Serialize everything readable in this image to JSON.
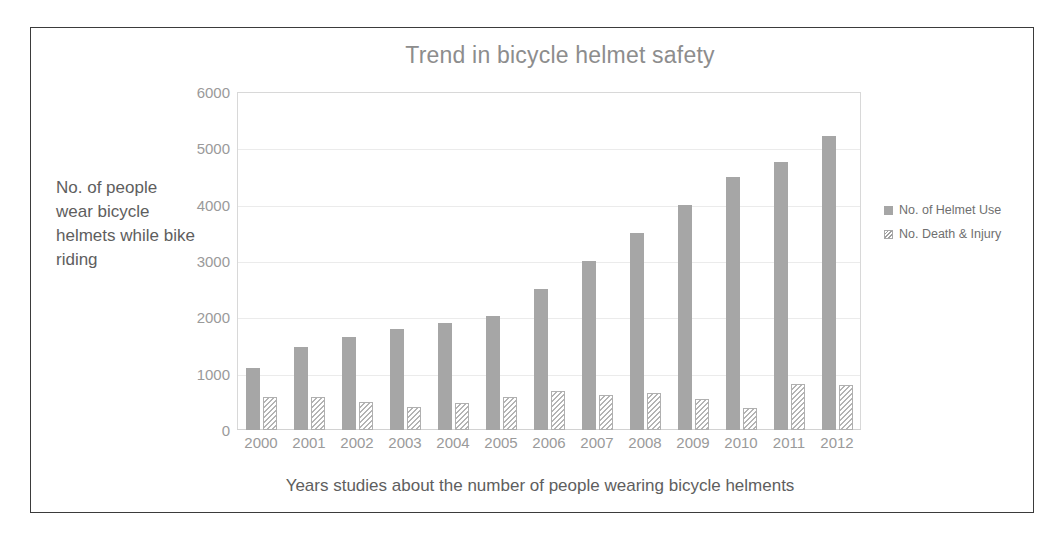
{
  "chart_data": {
    "type": "bar",
    "title": "Trend in bicycle helmet safety",
    "xlabel": "Years studies about the number of people wearing bicycle helments",
    "ylabel": "No. of people wear bicycle helmets while bike riding",
    "categories": [
      "2000",
      "2001",
      "2002",
      "2003",
      "2004",
      "2005",
      "2006",
      "2007",
      "2008",
      "2009",
      "2010",
      "2011",
      "2012"
    ],
    "series": [
      {
        "name": "No. of Helmet Use",
        "color": "#a6a6a6",
        "values": [
          1100,
          1480,
          1650,
          1790,
          1900,
          2020,
          2500,
          3000,
          3490,
          4000,
          4490,
          4760,
          5220
        ]
      },
      {
        "name": "No. Death & Injury",
        "color": "#ffffff",
        "values": [
          580,
          590,
          490,
          400,
          480,
          590,
          700,
          620,
          650,
          550,
          390,
          810,
          800
        ]
      }
    ],
    "ylim": [
      0,
      6000
    ],
    "yticks": [
      0,
      1000,
      2000,
      3000,
      4000,
      5000,
      6000
    ],
    "ytick_labels": [
      "0",
      "1000",
      "2000",
      "3000",
      "4000",
      "5000",
      "6000"
    ],
    "grid": true,
    "legend_position": "right"
  },
  "legend": {
    "entries": [
      {
        "label": "No. of Helmet Use",
        "swatch": "solid-gray-swatch"
      },
      {
        "label": "No. Death & Injury",
        "swatch": "hatched-swatch"
      }
    ]
  }
}
